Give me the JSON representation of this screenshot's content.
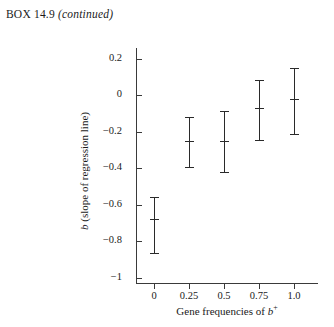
{
  "header": {
    "prefix": "BOX 14.9",
    "continued": "(continued)"
  },
  "chart_data": {
    "type": "scatter",
    "title": "",
    "xlabel_parts": {
      "text": "Gene frequencies of ",
      "symbol": "b",
      "superscript": "+"
    },
    "ylabel_parts": {
      "symbol": "b",
      "text": " (slope of regression line)"
    },
    "x": [
      0,
      0.25,
      0.5,
      0.75,
      1.0
    ],
    "x_tick_labels": [
      "0",
      "0.25",
      "0.5",
      "0.75",
      "1.0"
    ],
    "y_tick_labels": [
      "0.2",
      "0",
      "−0.2",
      "−0.4",
      "−0.6",
      "−0.8",
      "−1"
    ],
    "y_ticks": [
      0.2,
      0,
      -0.2,
      -0.4,
      -0.6,
      -0.8,
      -1
    ],
    "values": [
      -0.68,
      -0.25,
      -0.25,
      -0.07,
      -0.02
    ],
    "error_low": [
      -0.87,
      -0.4,
      -0.43,
      -0.25,
      -0.22
    ],
    "error_high": [
      -0.56,
      -0.12,
      -0.09,
      0.08,
      0.15
    ],
    "xlim": [
      -0.14,
      1.09
    ],
    "ylim": [
      -1.0,
      0.3
    ],
    "grid": false,
    "legend": "none"
  }
}
